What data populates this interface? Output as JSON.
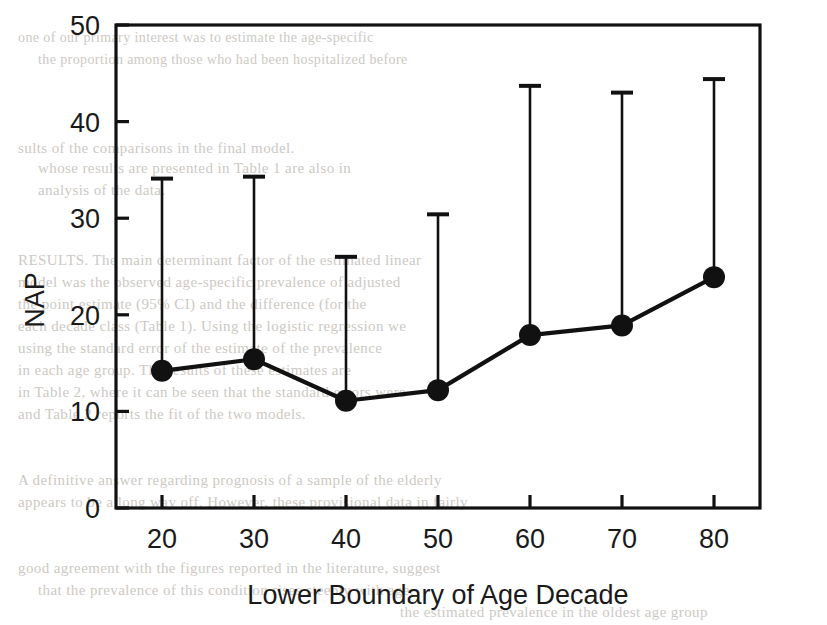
{
  "chart_data": {
    "type": "line",
    "title": "",
    "subtitle": "",
    "xlabel": "Lower Boundary of Age Decade",
    "ylabel": "NAP",
    "x": [
      20,
      30,
      40,
      50,
      60,
      70,
      80
    ],
    "categories": [
      "20",
      "30",
      "40",
      "50",
      "60",
      "70",
      "80"
    ],
    "values": [
      14.2,
      15.4,
      11.1,
      12.2,
      17.9,
      18.9,
      23.9
    ],
    "error_upper": [
      34.1,
      34.3,
      26.0,
      30.4,
      43.7,
      43.0,
      44.4
    ],
    "error_lower": [
      14.2,
      15.4,
      11.1,
      12.2,
      17.9,
      18.9,
      23.9
    ],
    "error_style": "upper-only",
    "series": [
      {
        "name": "NAP",
        "values": [
          14.2,
          15.4,
          11.1,
          12.2,
          17.9,
          18.9,
          23.9
        ],
        "marker": "filled-circle",
        "color": "#000000"
      }
    ],
    "xlim": [
      15,
      85
    ],
    "ylim": [
      0,
      50
    ],
    "xticks": [
      20,
      30,
      40,
      50,
      60,
      70,
      80
    ],
    "yticks": [
      0,
      10,
      20,
      30,
      40,
      50
    ],
    "xtick_labels": [
      "20",
      "30",
      "40",
      "50",
      "60",
      "70",
      "80"
    ],
    "ytick_labels": [
      "0",
      "10",
      "20",
      "30",
      "40",
      "50"
    ],
    "grid": false,
    "legend": false,
    "legend_position": "none",
    "frame": "box",
    "colors": {
      "line": "#000000",
      "marker": "#000000",
      "error_bar": "#000000",
      "axis": "#000000",
      "background": "#ffffff"
    }
  },
  "axes": {
    "y_label": "NAP",
    "x_label": "Lower Boundary of Age Decade",
    "y_ticks": [
      "50",
      "40",
      "30",
      "20",
      "10",
      "0"
    ],
    "x_ticks": [
      "20",
      "30",
      "40",
      "50",
      "60",
      "70",
      "80"
    ]
  },
  "page_scan": {
    "lines": [
      {
        "text": "one of our primary interest was to estimate the age-specific",
        "x": 18,
        "y": 30,
        "size": 14
      },
      {
        "text": "the proportion among those who had been hospitalized before",
        "x": 38,
        "y": 52,
        "size": 14
      },
      {
        "text": "sults of the comparisons in the final model.",
        "x": 18,
        "y": 140,
        "size": 15
      },
      {
        "text": "whose results are presented in Table 1 are also in",
        "x": 38,
        "y": 160,
        "size": 15
      },
      {
        "text": "analysis of the data.",
        "x": 38,
        "y": 182,
        "size": 15
      },
      {
        "text": "RESULTS. The main determinant factor of the estimated linear",
        "x": 18,
        "y": 252,
        "size": 15
      },
      {
        "text": "model was the observed age-specific prevalence of adjusted",
        "x": 18,
        "y": 274,
        "size": 15
      },
      {
        "text": "the point estimate (95% CI) and the difference (for the",
        "x": 18,
        "y": 296,
        "size": 15
      },
      {
        "text": "each decade class (Table 1). Using the logistic regression we",
        "x": 18,
        "y": 318,
        "size": 15
      },
      {
        "text": "using the standard error of the estimate of the prevalence",
        "x": 18,
        "y": 340,
        "size": 15
      },
      {
        "text": "in each age group. The results of these estimates are",
        "x": 18,
        "y": 362,
        "size": 15
      },
      {
        "text": "in Table 2, where it can be seen that the standard errors were",
        "x": 18,
        "y": 384,
        "size": 15
      },
      {
        "text": "and Table 2 reports the fit of the two models.",
        "x": 18,
        "y": 406,
        "size": 15
      },
      {
        "text": "A definitive answer regarding prognosis of a sample of the elderly",
        "x": 18,
        "y": 472,
        "size": 15
      },
      {
        "text": "appears to be a long way off. However, these provisional data in fairly",
        "x": 18,
        "y": 494,
        "size": 15
      },
      {
        "text": "good agreement with the figures reported in the literature, suggest",
        "x": 18,
        "y": 560,
        "size": 15
      },
      {
        "text": "that the prevalence of this condition rises steeply with age.",
        "x": 38,
        "y": 582,
        "size": 15
      },
      {
        "text": "the estimated prevalence in the oldest age group",
        "x": 400,
        "y": 604,
        "size": 15
      }
    ]
  }
}
